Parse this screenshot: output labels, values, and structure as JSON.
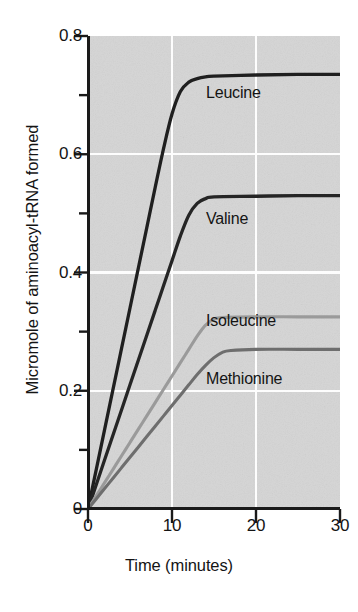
{
  "chart_data": {
    "type": "line",
    "title": "",
    "xlabel": "Time (minutes)",
    "ylabel": "Micromole of aminoacyl-tRNA formed",
    "xlim": [
      0,
      30
    ],
    "ylim": [
      0,
      0.8
    ],
    "x_ticks": [
      0,
      10,
      20,
      30
    ],
    "x_tick_labels": [
      "0",
      "10",
      "20",
      "30"
    ],
    "y_ticks": [
      0,
      0.2,
      0.4,
      0.6,
      0.8
    ],
    "y_tick_labels": [
      "0",
      "0.2",
      "0.4",
      "0.6",
      "0.8"
    ],
    "y_minor_ticks": [
      0.1,
      0.3,
      0.5,
      0.7
    ],
    "grid": "white gridlines at major ticks, both axes",
    "legend_position": "inline labels beside each curve",
    "plot_background": "#d4d4d4",
    "series": [
      {
        "name": "Leucine",
        "color": "#1f1f1f",
        "plateau": 0.735,
        "knee_minutes": 11,
        "x": [
          0,
          1,
          2,
          3,
          4,
          5,
          6,
          7,
          8,
          9,
          10,
          11,
          12,
          13,
          14,
          15,
          20,
          25,
          30
        ],
        "values": [
          0,
          0.068,
          0.136,
          0.204,
          0.272,
          0.34,
          0.408,
          0.476,
          0.544,
          0.61,
          0.668,
          0.706,
          0.722,
          0.728,
          0.731,
          0.732,
          0.734,
          0.735,
          0.735
        ]
      },
      {
        "name": "Valine",
        "color": "#252525",
        "plateau": 0.53,
        "knee_minutes": 13,
        "x": [
          0,
          1,
          2,
          3,
          4,
          5,
          6,
          7,
          8,
          9,
          10,
          11,
          12,
          13,
          14,
          15,
          20,
          25,
          30
        ],
        "values": [
          0,
          0.042,
          0.084,
          0.126,
          0.168,
          0.21,
          0.252,
          0.294,
          0.336,
          0.378,
          0.42,
          0.462,
          0.497,
          0.517,
          0.525,
          0.528,
          0.529,
          0.53,
          0.53
        ]
      },
      {
        "name": "Isoleucine",
        "color": "#9a9a9a",
        "plateau": 0.325,
        "knee_minutes": 15,
        "x": [
          0,
          1,
          2,
          3,
          4,
          5,
          6,
          7,
          8,
          9,
          10,
          11,
          12,
          13,
          14,
          15,
          16,
          20,
          25,
          30
        ],
        "values": [
          0,
          0.0225,
          0.045,
          0.0675,
          0.09,
          0.1125,
          0.135,
          0.1575,
          0.18,
          0.2025,
          0.225,
          0.2475,
          0.27,
          0.2925,
          0.311,
          0.321,
          0.324,
          0.325,
          0.325,
          0.325
        ]
      },
      {
        "name": "Methionine",
        "color": "#6e6e6e",
        "plateau": 0.27,
        "knee_minutes": 16,
        "x": [
          0,
          1,
          2,
          3,
          4,
          5,
          6,
          7,
          8,
          9,
          10,
          11,
          12,
          13,
          14,
          15,
          16,
          17,
          20,
          25,
          30
        ],
        "values": [
          0,
          0.0175,
          0.035,
          0.0525,
          0.07,
          0.0875,
          0.105,
          0.1225,
          0.14,
          0.1575,
          0.175,
          0.1925,
          0.21,
          0.2275,
          0.243,
          0.256,
          0.265,
          0.268,
          0.27,
          0.27,
          0.27
        ]
      }
    ],
    "series_label_positions": [
      {
        "name": "Leucine",
        "left": 206,
        "top": 84
      },
      {
        "name": "Valine",
        "left": 206,
        "top": 210
      },
      {
        "name": "Isoleucine",
        "left": 206,
        "top": 312
      },
      {
        "name": "Methionine",
        "left": 206,
        "top": 370
      }
    ]
  }
}
